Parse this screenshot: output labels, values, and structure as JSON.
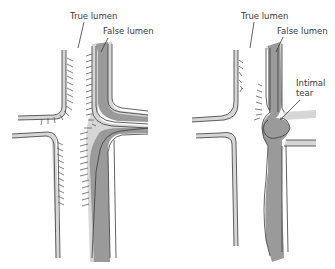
{
  "diagram": {
    "left_panel": {
      "labels": {
        "true_lumen": "True lumen",
        "false_lumen": "False lumen"
      }
    },
    "right_panel": {
      "labels": {
        "true_lumen": "True lumen",
        "false_lumen": "False lumen",
        "intimal_tear_line1": "Intimal",
        "intimal_tear_line2": "tear"
      }
    },
    "colors": {
      "wall": "#d9d9d9",
      "false_lumen": "#9a9a9a",
      "outline": "#3a3a3a",
      "background": "#ffffff"
    }
  }
}
